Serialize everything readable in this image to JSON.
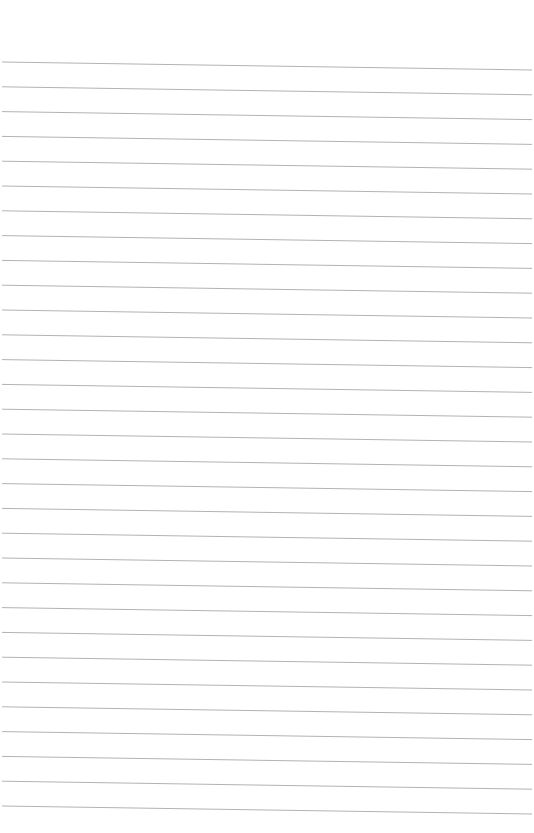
{
  "page": {
    "type": "lined-paper",
    "background": "#ffffff",
    "line_color": "#a9a9a9",
    "line_count": 31,
    "first_line_y_left": 62,
    "line_spacing": 24.8,
    "slant_px": 8,
    "line_x_start": 2,
    "line_x_end": 532
  }
}
